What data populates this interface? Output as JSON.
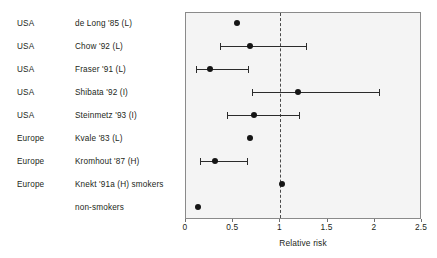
{
  "chart_data": {
    "type": "scatter",
    "title": "",
    "xlabel": "Relative risk",
    "ylabel": "",
    "xlim": [
      0,
      2.5
    ],
    "xticks": [
      0,
      0.5,
      1,
      1.5,
      2,
      2.5
    ],
    "xtick_labels": [
      "0",
      "0.5",
      "1",
      "1.5",
      "2",
      "2.5"
    ],
    "grid": false,
    "legend": "none",
    "reference_line": 1,
    "annotations": [],
    "columns": [
      "region",
      "study"
    ],
    "points": [
      {
        "region": "USA",
        "study": "de Long '85 (L)",
        "value": 0.54,
        "ci_low": null,
        "ci_high": null
      },
      {
        "region": "USA",
        "study": "Chow '92 (L)",
        "value": 0.68,
        "ci_low": 0.36,
        "ci_high": 1.27
      },
      {
        "region": "USA",
        "study": "Fraser '91 (L)",
        "value": 0.25,
        "ci_low": 0.11,
        "ci_high": 0.66
      },
      {
        "region": "USA",
        "study": "Shibata '92 (I)",
        "value": 1.19,
        "ci_low": 0.7,
        "ci_high": 2.04
      },
      {
        "region": "USA",
        "study": "Steinmetz '93 (I)",
        "value": 0.72,
        "ci_low": 0.43,
        "ci_high": 1.2
      },
      {
        "region": "Europe",
        "study": "Kvale '83 (L)",
        "value": 0.68,
        "ci_low": null,
        "ci_high": null
      },
      {
        "region": "Europe",
        "study": "Kromhout '87 (H)",
        "value": 0.31,
        "ci_low": 0.15,
        "ci_high": 0.65
      },
      {
        "region": "Europe",
        "study": "Knekt '91a (H) smokers",
        "value": 1.02,
        "ci_low": null,
        "ci_high": null
      },
      {
        "region": "",
        "study": "non-smokers",
        "value": 0.13,
        "ci_low": null,
        "ci_high": null
      }
    ]
  },
  "colors": {
    "marker": "#151515",
    "ci_line": "#2b2b2b",
    "panel_background": "#f4f4f4",
    "panel_border": "#8a8a8a",
    "reference_line": "#4a4a4a",
    "text": "#231f20"
  }
}
